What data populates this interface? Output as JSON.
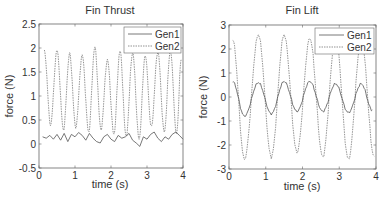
{
  "chart_data": [
    {
      "type": "line",
      "title": "Fin Thrust",
      "xlabel": "time (s)",
      "ylabel": "force (N)",
      "xlim": [
        0,
        4
      ],
      "ylim": [
        -0.5,
        2.5
      ],
      "xticks": [
        "0",
        "1",
        "2",
        "3",
        "4"
      ],
      "yticks": [
        "-0.5",
        "0",
        "0.5",
        "1",
        "1.5",
        "2",
        "2.5"
      ],
      "grid": false,
      "legend_position": "upper right",
      "series": [
        {
          "name": "Gen1",
          "style": "solid",
          "description": "small oscillation around ~0.12 N with noise",
          "x": [
            0.1,
            0.2,
            0.3,
            0.4,
            0.5,
            0.6,
            0.7,
            0.8,
            0.9,
            1.0,
            1.1,
            1.2,
            1.3,
            1.4,
            1.5,
            1.6,
            1.7,
            1.8,
            1.9,
            2.0,
            2.1,
            2.2,
            2.3,
            2.4,
            2.5,
            2.6,
            2.7,
            2.8,
            2.9,
            3.0,
            3.1,
            3.2,
            3.3,
            3.4,
            3.5,
            3.6,
            3.7,
            3.8,
            3.9,
            4.0
          ],
          "y": [
            0.15,
            0.12,
            0.18,
            0.1,
            0.2,
            0.08,
            0.22,
            0.05,
            0.2,
            0.15,
            0.24,
            0.18,
            0.08,
            0.22,
            0.12,
            0.05,
            0.02,
            0.15,
            0.2,
            0.1,
            0.05,
            0.18,
            0.12,
            0.15,
            0.22,
            0.08,
            0.02,
            -0.05,
            0.15,
            0.1,
            0.2,
            0.25,
            0.12,
            0.05,
            0.15,
            0.1,
            0.2,
            0.25,
            0.18,
            0.1
          ]
        },
        {
          "name": "Gen2",
          "style": "dashed",
          "description": "large oscillation ~0.3 to ~1.95 N, period ~0.36 s",
          "peaks_x": [
            0.15,
            0.5,
            0.85,
            1.2,
            1.55,
            1.9,
            2.25,
            2.6,
            2.95,
            3.3,
            3.65,
            3.95
          ],
          "peaks_y": [
            1.93,
            1.95,
            1.88,
            1.85,
            2.02,
            1.75,
            1.95,
            1.9,
            1.85,
            1.92,
            1.95,
            1.75
          ],
          "troughs_x": [
            0.32,
            0.68,
            1.02,
            1.38,
            1.72,
            2.08,
            2.42,
            2.78,
            3.12,
            3.48,
            3.82
          ],
          "troughs_y": [
            0.4,
            0.3,
            0.35,
            0.25,
            0.3,
            0.2,
            0.15,
            0.1,
            0.35,
            0.25,
            0.2
          ]
        }
      ]
    },
    {
      "type": "line",
      "title": "Fin Lift",
      "xlabel": "time (s)",
      "ylabel": "force (N)",
      "xlim": [
        0,
        4
      ],
      "ylim": [
        -3,
        3
      ],
      "xticks": [
        "0",
        "1",
        "2",
        "3",
        "4"
      ],
      "yticks": [
        "-3",
        "-2",
        "-1",
        "0",
        "1",
        "2",
        "3"
      ],
      "grid": false,
      "legend_position": "upper right",
      "series": [
        {
          "name": "Gen1",
          "style": "solid",
          "description": "sinusoid amplitude ~0.6 N, period ~0.7 s",
          "peaks_x": [
            0.1,
            0.8,
            1.5,
            2.2,
            2.9,
            3.6
          ],
          "peaks_y": [
            0.65,
            0.6,
            0.65,
            0.65,
            0.55,
            0.55
          ],
          "troughs_x": [
            0.42,
            1.15,
            1.85,
            2.55,
            3.25,
            3.9
          ],
          "troughs_y": [
            -0.8,
            -0.7,
            -0.6,
            -0.6,
            -0.65,
            -0.55
          ]
        },
        {
          "name": "Gen2",
          "style": "dashed",
          "description": "sinusoid amplitude ~2.5 N, period ~0.7 s",
          "peaks_x": [
            0.1,
            0.8,
            1.5,
            2.2,
            2.9,
            3.6
          ],
          "peaks_y": [
            2.4,
            2.6,
            2.6,
            2.45,
            2.5,
            2.4
          ],
          "troughs_x": [
            0.42,
            1.15,
            1.85,
            2.55,
            3.25,
            3.95
          ],
          "troughs_y": [
            -2.6,
            -2.5,
            -2.3,
            -2.5,
            -2.6,
            -2.5
          ]
        }
      ]
    }
  ],
  "charts": {
    "left": {
      "title": "Fin Thrust",
      "xlabel": "time (s)",
      "ylabel": "force (N)",
      "legend": [
        "Gen1",
        "Gen2"
      ]
    },
    "right": {
      "title": "Fin Lift",
      "xlabel": "time (s)",
      "ylabel": "force (N)",
      "legend": [
        "Gen1",
        "Gen2"
      ]
    }
  },
  "colors": {
    "gen1": "#555555",
    "gen2": "#777777",
    "axes": "#666666",
    "text": "#333333"
  }
}
